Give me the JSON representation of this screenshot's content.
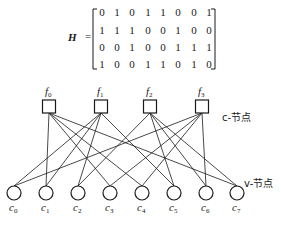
{
  "matrix": {
    "label": "H",
    "equals": "=",
    "rows": [
      [
        "0",
        "1",
        "0",
        "1",
        "1",
        "0",
        "0",
        "1"
      ],
      [
        "1",
        "1",
        "1",
        "0",
        "0",
        "1",
        "0",
        "0"
      ],
      [
        "0",
        "0",
        "1",
        "0",
        "0",
        "1",
        "1",
        "1"
      ],
      [
        "1",
        "0",
        "0",
        "1",
        "1",
        "0",
        "1",
        "0"
      ]
    ]
  },
  "check_nodes": {
    "group_label": "c-节点",
    "nodes": [
      {
        "base": "f",
        "sub": "0"
      },
      {
        "base": "f",
        "sub": "1"
      },
      {
        "base": "f",
        "sub": "2"
      },
      {
        "base": "f",
        "sub": "3"
      }
    ]
  },
  "variable_nodes": {
    "group_label": "v-节点",
    "nodes": [
      {
        "base": "c",
        "sub": "0"
      },
      {
        "base": "c",
        "sub": "1"
      },
      {
        "base": "c",
        "sub": "2"
      },
      {
        "base": "c",
        "sub": "3"
      },
      {
        "base": "c",
        "sub": "4"
      },
      {
        "base": "c",
        "sub": "5"
      },
      {
        "base": "c",
        "sub": "6"
      },
      {
        "base": "c",
        "sub": "7"
      }
    ]
  },
  "colors": {
    "stroke": "#1a1a1a",
    "background": "#ffffff"
  }
}
